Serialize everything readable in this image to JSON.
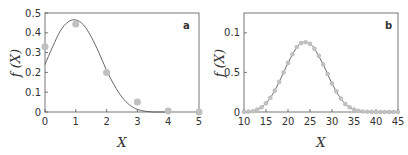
{
  "chart_data": [
    {
      "type": "scatter",
      "panel": "a",
      "title": "",
      "xlabel": "X",
      "ylabel": "f (X)",
      "xlim": [
        0,
        5
      ],
      "ylim": [
        0,
        0.5
      ],
      "xticks": [
        "0",
        "1",
        "2",
        "3",
        "4",
        "5"
      ],
      "yticks": [
        "0",
        "0.1",
        "0.2",
        "0.3",
        "0.4",
        "0.5"
      ],
      "grid": false,
      "series": [
        {
          "name": "observed",
          "kind": "points",
          "x": [
            0,
            1,
            2,
            3,
            4,
            5
          ],
          "y": [
            0.33,
            0.445,
            0.2,
            0.05,
            0.005,
            0.0
          ]
        },
        {
          "name": "fitted",
          "kind": "line",
          "x": [
            0,
            0.25,
            0.5,
            0.75,
            1.0,
            1.25,
            1.5,
            1.75,
            2.0,
            2.25,
            2.5,
            2.75,
            3.0,
            3.25,
            3.5,
            3.75,
            4.0
          ],
          "y": [
            0.24,
            0.33,
            0.41,
            0.455,
            0.465,
            0.44,
            0.38,
            0.3,
            0.21,
            0.135,
            0.075,
            0.035,
            0.013,
            0.004,
            0.0,
            0.0,
            0.0
          ]
        }
      ]
    },
    {
      "type": "scatter",
      "panel": "b",
      "title": "",
      "xlabel": "X",
      "ylabel": "f (X)",
      "xlim": [
        10,
        45
      ],
      "ylim": [
        0,
        0.125
      ],
      "xticks": [
        "10",
        "15",
        "20",
        "25",
        "30",
        "35",
        "40",
        "45"
      ],
      "yticks": [
        "0",
        "0.5",
        "0.1"
      ],
      "grid": false,
      "series": [
        {
          "name": "observed",
          "kind": "points",
          "x": [
            10,
            11,
            12,
            13,
            14,
            15,
            16,
            17,
            18,
            19,
            20,
            21,
            22,
            23,
            24,
            25,
            26,
            27,
            28,
            29,
            30,
            31,
            32,
            33,
            34,
            35,
            36,
            37,
            38,
            39,
            40,
            41,
            42,
            43,
            44,
            45
          ],
          "y": [
            0.0,
            0.0005,
            0.001,
            0.003,
            0.006,
            0.011,
            0.018,
            0.027,
            0.038,
            0.05,
            0.062,
            0.073,
            0.082,
            0.087,
            0.088,
            0.086,
            0.08,
            0.071,
            0.06,
            0.048,
            0.036,
            0.026,
            0.017,
            0.01,
            0.006,
            0.003,
            0.0015,
            0.0007,
            0.0003,
            0.0001,
            0.0,
            0.0,
            0.0,
            0.0,
            0.0,
            0.0
          ]
        },
        {
          "name": "fitted",
          "kind": "line",
          "x": [
            10,
            12,
            14,
            16,
            18,
            20,
            22,
            23,
            24,
            25,
            26,
            28,
            30,
            32,
            34,
            36,
            38,
            40,
            45
          ],
          "y": [
            0.0,
            0.001,
            0.006,
            0.018,
            0.038,
            0.062,
            0.082,
            0.087,
            0.088,
            0.086,
            0.08,
            0.06,
            0.036,
            0.017,
            0.006,
            0.0015,
            0.0003,
            0.0,
            0.0
          ]
        }
      ]
    }
  ],
  "labels": {
    "a": {
      "panel": "a",
      "xlabel": "X",
      "ylabel": "f (X)"
    },
    "b": {
      "panel": "b",
      "xlabel": "X",
      "ylabel": "f (X)"
    }
  },
  "colors": {
    "axis": "#555555",
    "line": "#555555",
    "points": "#c0c0c0",
    "text": "#333333"
  }
}
